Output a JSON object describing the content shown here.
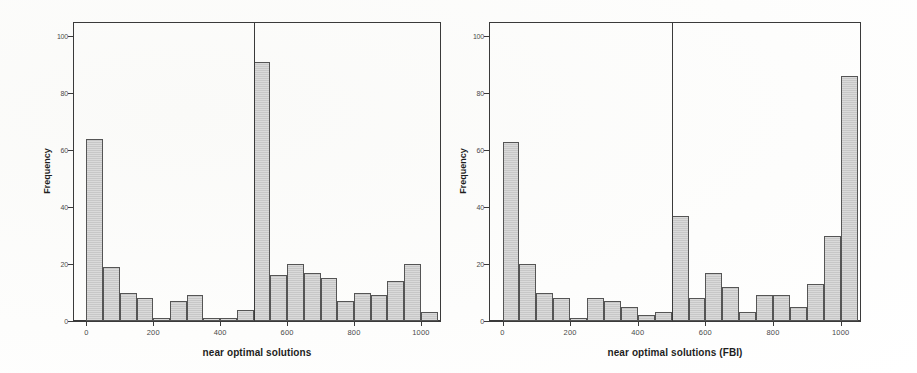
{
  "figure": {
    "background_color": "#ffffff",
    "bar_fill_color": "#cacaca",
    "bar_edge_color": "#555555",
    "axis_color": "#3a3a3a"
  },
  "chart_data": [
    {
      "type": "bar",
      "title": "",
      "xlabel": "near optimal solutions",
      "ylabel": "Frequency",
      "xlim": [
        -40,
        1060
      ],
      "ylim": [
        0,
        105
      ],
      "grid": false,
      "legend": null,
      "xticks": [
        0,
        200,
        400,
        600,
        800,
        1000
      ],
      "xtick_labels": [
        "0",
        "200",
        "400",
        "600",
        "800",
        "1000"
      ],
      "yticks": [
        0,
        20,
        40,
        60,
        80,
        100
      ],
      "ytick_labels": [
        "0",
        "20",
        "40",
        "60",
        "80",
        "100"
      ],
      "bin_width": 50,
      "bin_starts": [
        0,
        50,
        100,
        150,
        200,
        250,
        300,
        350,
        400,
        450,
        500,
        550,
        600,
        650,
        700,
        750,
        800,
        850,
        900,
        950,
        1000
      ],
      "categories": [
        "0-50",
        "50-100",
        "100-150",
        "150-200",
        "200-250",
        "250-300",
        "300-350",
        "350-400",
        "400-450",
        "450-500",
        "500-550",
        "550-600",
        "600-650",
        "650-700",
        "700-750",
        "750-800",
        "800-850",
        "850-900",
        "900-950",
        "950-1000",
        "1000-1050"
      ],
      "values": [
        64,
        19,
        10,
        8,
        1,
        7,
        9,
        1,
        1,
        4,
        91,
        16,
        20,
        17,
        15,
        7,
        10,
        9,
        14,
        20,
        3
      ],
      "annotations": [
        {
          "type": "vertical-line",
          "x": 500
        }
      ]
    },
    {
      "type": "bar",
      "title": "",
      "xlabel": "near optimal solutions (FBI)",
      "ylabel": "Frequency",
      "xlim": [
        -40,
        1060
      ],
      "ylim": [
        0,
        105
      ],
      "grid": false,
      "legend": null,
      "xticks": [
        0,
        200,
        400,
        600,
        800,
        1000
      ],
      "xtick_labels": [
        "0",
        "200",
        "400",
        "600",
        "800",
        "1000"
      ],
      "yticks": [
        0,
        20,
        40,
        60,
        80,
        100
      ],
      "ytick_labels": [
        "0",
        "20",
        "40",
        "60",
        "80",
        "100"
      ],
      "bin_width": 50,
      "bin_starts": [
        0,
        50,
        100,
        150,
        200,
        250,
        300,
        350,
        400,
        450,
        500,
        550,
        600,
        650,
        700,
        750,
        800,
        850,
        900,
        950,
        1000
      ],
      "categories": [
        "0-50",
        "50-100",
        "100-150",
        "150-200",
        "200-250",
        "250-300",
        "300-350",
        "350-400",
        "400-450",
        "450-500",
        "500-550",
        "550-600",
        "600-650",
        "650-700",
        "700-750",
        "750-800",
        "800-850",
        "850-900",
        "900-950",
        "950-1000",
        "1000-1050"
      ],
      "values": [
        63,
        20,
        10,
        8,
        1,
        8,
        7,
        5,
        2,
        3,
        37,
        8,
        17,
        12,
        3,
        9,
        9,
        5,
        13,
        30,
        86
      ],
      "annotations": [
        {
          "type": "vertical-line",
          "x": 500
        }
      ]
    }
  ],
  "panels": {
    "left": {
      "name": "histogram-near-optimal-solutions",
      "xlabel": "near optimal solutions",
      "ylabel": "Frequency"
    },
    "right": {
      "name": "histogram-near-optimal-solutions-fbi",
      "xlabel": "near optimal solutions (FBI)",
      "ylabel": "Frequency"
    }
  }
}
